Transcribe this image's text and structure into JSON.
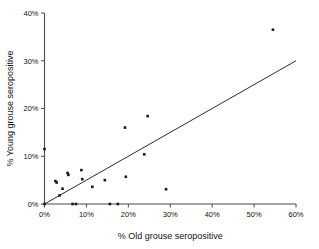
{
  "chart_data": {
    "type": "scatter",
    "title": "",
    "xlabel": "% Old grouse seropositive",
    "ylabel": "% Young grouse seropositive",
    "xlim": [
      0,
      60
    ],
    "ylim": [
      0,
      40
    ],
    "xticks": [
      "0%",
      "10%",
      "20%",
      "30%",
      "40%",
      "50%",
      "60%"
    ],
    "xtick_values": [
      0,
      10,
      20,
      30,
      40,
      50,
      60
    ],
    "yticks": [
      "0%",
      "10%",
      "20%",
      "30%",
      "40%"
    ],
    "ytick_values": [
      0,
      10,
      20,
      30,
      40
    ],
    "grid": false,
    "legend": false,
    "marker": "square",
    "marker_color": "#1a1a1a",
    "line_color": "#2b2b2b",
    "points": [
      {
        "x": 0.0,
        "y": 11.5
      },
      {
        "x": 0.0,
        "y": 0.0
      },
      {
        "x": 2.6,
        "y": 4.8
      },
      {
        "x": 2.9,
        "y": 4.5
      },
      {
        "x": 3.6,
        "y": 1.8
      },
      {
        "x": 4.3,
        "y": 3.2
      },
      {
        "x": 5.5,
        "y": 6.5
      },
      {
        "x": 5.7,
        "y": 6.1
      },
      {
        "x": 6.7,
        "y": 0.0
      },
      {
        "x": 7.5,
        "y": 0.0
      },
      {
        "x": 8.8,
        "y": 7.1
      },
      {
        "x": 9.0,
        "y": 5.2
      },
      {
        "x": 11.4,
        "y": 3.6
      },
      {
        "x": 14.4,
        "y": 5.0
      },
      {
        "x": 15.6,
        "y": 0.0
      },
      {
        "x": 17.5,
        "y": 0.0
      },
      {
        "x": 19.2,
        "y": 16.0
      },
      {
        "x": 19.4,
        "y": 5.7
      },
      {
        "x": 23.8,
        "y": 10.4
      },
      {
        "x": 24.6,
        "y": 18.4
      },
      {
        "x": 29.0,
        "y": 3.1
      },
      {
        "x": 54.5,
        "y": 36.5
      }
    ],
    "fit_line": {
      "x0": 0,
      "y0": 0,
      "x1": 60,
      "y1": 30,
      "slope": 0.5,
      "intercept": 0
    }
  }
}
